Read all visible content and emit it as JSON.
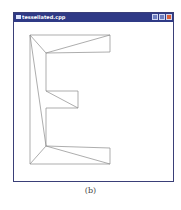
{
  "window": {
    "title": "tessellated.cpp",
    "controls": [
      "minimize",
      "maximize",
      "close"
    ],
    "colors": {
      "titlebar": "#2f3a86",
      "close": "#d9603a",
      "stroke": "#8a8a8a"
    }
  },
  "drawing": {
    "outline": [
      [
        30,
        35
      ],
      [
        110,
        35
      ],
      [
        110,
        52
      ],
      [
        46,
        53
      ],
      [
        46,
        91
      ],
      [
        78,
        91
      ],
      [
        78,
        108
      ],
      [
        46,
        108
      ],
      [
        46,
        146
      ],
      [
        110,
        148
      ],
      [
        110,
        164
      ],
      [
        30,
        164
      ]
    ],
    "diagonals": [
      [
        [
          30,
          35
        ],
        [
          46,
          53
        ]
      ],
      [
        [
          46,
          53
        ],
        [
          110,
          35
        ]
      ],
      [
        [
          30,
          35
        ],
        [
          46,
          146
        ]
      ],
      [
        [
          46,
          91
        ],
        [
          78,
          108
        ]
      ],
      [
        [
          46,
          146
        ],
        [
          30,
          164
        ]
      ],
      [
        [
          46,
          146
        ],
        [
          110,
          164
        ]
      ]
    ]
  },
  "caption": "(b)"
}
